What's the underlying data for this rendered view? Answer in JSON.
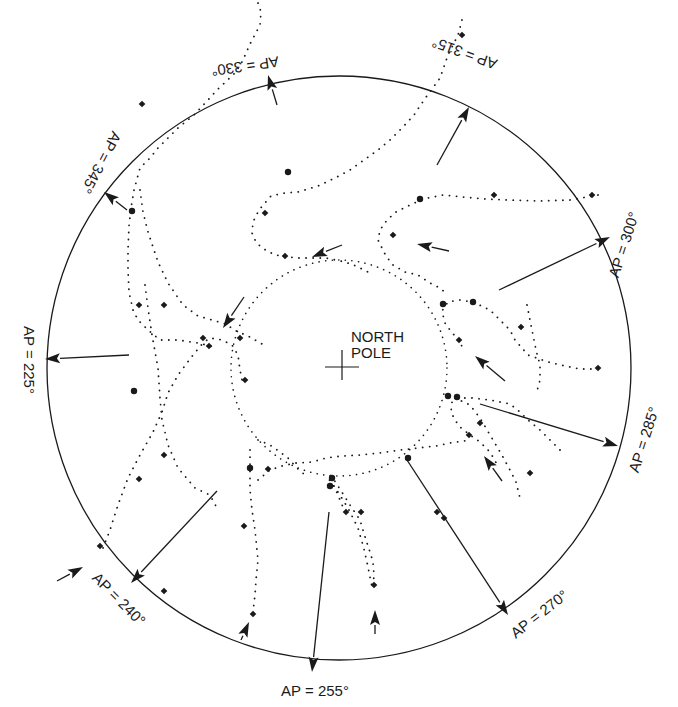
{
  "diagram": {
    "center_label_line1": "NORTH",
    "center_label_line2": "POLE",
    "top_clipped_text": "",
    "colors": {
      "ink": "#1a1a1a",
      "background": "#ffffff"
    },
    "outer_circle": {
      "cx": 339,
      "cy": 368,
      "r": 292
    },
    "inner_dotted_circle": {
      "cx": 339,
      "cy": 368,
      "r": 108
    },
    "labels": [
      {
        "text": "AP = 330°",
        "x": 245,
        "y": 65,
        "rotate": 172
      },
      {
        "text": "AP = 315°",
        "x": 465,
        "y": 52,
        "rotate": 200
      },
      {
        "text": "AP = 345°",
        "x": 100,
        "y": 162,
        "rotate": 118
      },
      {
        "text": "AP = 300°",
        "x": 625,
        "y": 245,
        "rotate": -72
      },
      {
        "text": "AP = 225°",
        "x": 28,
        "y": 360,
        "rotate": 90
      },
      {
        "text": "AP = 285°",
        "x": 645,
        "y": 440,
        "rotate": -72
      },
      {
        "text": "AP = 240°",
        "x": 118,
        "y": 600,
        "rotate": 45
      },
      {
        "text": "AP = 270°",
        "x": 540,
        "y": 615,
        "rotate": -38
      },
      {
        "text": "AP = 255°",
        "x": 315,
        "y": 692,
        "rotate": 0
      }
    ],
    "arrows": [
      {
        "x1": 277,
        "y1": 105,
        "x2": 268,
        "y2": 75
      },
      {
        "x1": 437,
        "y1": 165,
        "x2": 469,
        "y2": 107
      },
      {
        "x1": 127,
        "y1": 210,
        "x2": 104,
        "y2": 192
      },
      {
        "x1": 499,
        "y1": 290,
        "x2": 610,
        "y2": 237
      },
      {
        "x1": 129,
        "y1": 355,
        "x2": 45,
        "y2": 359
      },
      {
        "x1": 480,
        "y1": 404,
        "x2": 618,
        "y2": 446
      },
      {
        "x1": 217,
        "y1": 491,
        "x2": 131,
        "y2": 583
      },
      {
        "x1": 407,
        "y1": 460,
        "x2": 508,
        "y2": 615
      },
      {
        "x1": 329,
        "y1": 512,
        "x2": 312,
        "y2": 672
      },
      {
        "x1": 342,
        "y1": 245,
        "x2": 312,
        "y2": 257
      },
      {
        "x1": 244,
        "y1": 297,
        "x2": 223,
        "y2": 328
      },
      {
        "x1": 449,
        "y1": 251,
        "x2": 417,
        "y2": 244
      },
      {
        "x1": 505,
        "y1": 381,
        "x2": 475,
        "y2": 356
      },
      {
        "x1": 502,
        "y1": 481,
        "x2": 484,
        "y2": 456
      },
      {
        "x1": 57,
        "y1": 581,
        "x2": 83,
        "y2": 567
      },
      {
        "x1": 241,
        "y1": 640,
        "x2": 249,
        "y2": 622
      },
      {
        "x1": 375,
        "y1": 634,
        "x2": 375,
        "y2": 610
      }
    ],
    "tracks": [
      {
        "name": "track-330",
        "points": [
          [
            258,
            3
          ],
          [
            261,
            12
          ],
          [
            260,
            25
          ],
          [
            250,
            44
          ],
          [
            243,
            60
          ],
          [
            236,
            72
          ],
          [
            217,
            90
          ],
          [
            208,
            100
          ],
          [
            194,
            115
          ],
          [
            178,
            128
          ],
          [
            168,
            138
          ],
          [
            158,
            148
          ],
          [
            150,
            158
          ],
          [
            140,
            168
          ],
          [
            134,
            190
          ],
          [
            131,
            208
          ],
          [
            129,
            226
          ],
          [
            128,
            250
          ],
          [
            128,
            270
          ],
          [
            129,
            292
          ],
          [
            133,
            310
          ],
          [
            138,
            320
          ],
          [
            148,
            330
          ],
          [
            160,
            340
          ],
          [
            178,
            340
          ],
          [
            198,
            343
          ],
          [
            214,
            347
          ]
        ]
      },
      {
        "name": "track-315",
        "points": [
          [
            462,
            20
          ],
          [
            458,
            35
          ],
          [
            448,
            55
          ],
          [
            440,
            78
          ],
          [
            424,
            100
          ],
          [
            414,
            115
          ],
          [
            402,
            128
          ],
          [
            390,
            140
          ],
          [
            378,
            150
          ],
          [
            364,
            160
          ],
          [
            350,
            170
          ],
          [
            335,
            178
          ],
          [
            318,
            186
          ],
          [
            298,
            192
          ],
          [
            285,
            193
          ],
          [
            271,
            196
          ],
          [
            259,
            210
          ],
          [
            253,
            222
          ],
          [
            252,
            233
          ],
          [
            256,
            242
          ],
          [
            262,
            248
          ],
          [
            275,
            255
          ],
          [
            296,
            258
          ],
          [
            326,
            258
          ],
          [
            345,
            262
          ],
          [
            356,
            266
          ],
          [
            368,
            272
          ]
        ]
      },
      {
        "name": "track-345-loop",
        "points": [
          [
            140,
            190
          ],
          [
            143,
            212
          ],
          [
            148,
            232
          ],
          [
            158,
            262
          ],
          [
            168,
            283
          ],
          [
            183,
            305
          ],
          [
            198,
            316
          ],
          [
            212,
            320
          ],
          [
            226,
            324
          ],
          [
            234,
            330
          ],
          [
            248,
            336
          ],
          [
            262,
            344
          ]
        ]
      },
      {
        "name": "track-300",
        "points": [
          [
            598,
            195
          ],
          [
            570,
            200
          ],
          [
            540,
            201
          ],
          [
            510,
            200
          ],
          [
            485,
            199
          ],
          [
            462,
            197
          ],
          [
            443,
            195
          ],
          [
            423,
            199
          ],
          [
            410,
            205
          ],
          [
            396,
            212
          ],
          [
            387,
            220
          ],
          [
            380,
            230
          ],
          [
            378,
            240
          ],
          [
            386,
            256
          ],
          [
            393,
            265
          ],
          [
            405,
            272
          ],
          [
            418,
            275
          ],
          [
            430,
            283
          ],
          [
            440,
            288
          ],
          [
            448,
            295
          ]
        ]
      },
      {
        "name": "track-285",
        "points": [
          [
            598,
            369
          ],
          [
            580,
            369
          ],
          [
            565,
            366
          ],
          [
            548,
            362
          ],
          [
            528,
            355
          ],
          [
            515,
            340
          ],
          [
            510,
            330
          ],
          [
            500,
            320
          ],
          [
            490,
            310
          ],
          [
            473,
            302
          ],
          [
            460,
            300
          ],
          [
            448,
            302
          ],
          [
            442,
            311
          ],
          [
            445,
            323
          ],
          [
            452,
            333
          ],
          [
            460,
            340
          ],
          [
            462,
            347
          ]
        ]
      },
      {
        "name": "track-285b",
        "points": [
          [
            527,
            305
          ],
          [
            530,
            320
          ],
          [
            533,
            335
          ],
          [
            536,
            350
          ],
          [
            540,
            365
          ],
          [
            540,
            380
          ],
          [
            536,
            395
          ]
        ]
      },
      {
        "name": "track-270a",
        "points": [
          [
            560,
            450
          ],
          [
            550,
            440
          ],
          [
            540,
            430
          ],
          [
            528,
            420
          ],
          [
            520,
            412
          ],
          [
            510,
            404
          ],
          [
            490,
            400
          ],
          [
            472,
            398
          ],
          [
            460,
            398
          ],
          [
            452,
            402
          ],
          [
            451,
            412
          ],
          [
            455,
            420
          ],
          [
            460,
            427
          ],
          [
            470,
            435
          ],
          [
            480,
            442
          ],
          [
            490,
            452
          ],
          [
            498,
            466
          ]
        ]
      },
      {
        "name": "track-270b",
        "points": [
          [
            455,
            398
          ],
          [
            470,
            405
          ],
          [
            480,
            418
          ],
          [
            493,
            440
          ],
          [
            503,
            457
          ],
          [
            510,
            470
          ],
          [
            516,
            482
          ],
          [
            520,
            498
          ]
        ]
      },
      {
        "name": "track-255",
        "points": [
          [
            345,
            512
          ],
          [
            335,
            488
          ],
          [
            328,
            478
          ],
          [
            330,
            475
          ],
          [
            334,
            480
          ],
          [
            340,
            489
          ],
          [
            350,
            505
          ],
          [
            360,
            520
          ],
          [
            366,
            540
          ],
          [
            370,
            552
          ],
          [
            373,
            562
          ],
          [
            374,
            575
          ],
          [
            373,
            588
          ]
        ]
      },
      {
        "name": "track-255b",
        "points": [
          [
            330,
            480
          ],
          [
            338,
            492
          ],
          [
            348,
            508
          ],
          [
            358,
            528
          ],
          [
            364,
            549
          ],
          [
            368,
            567
          ],
          [
            372,
            587
          ]
        ]
      },
      {
        "name": "track-240",
        "points": [
          [
            250,
            450
          ],
          [
            250,
            470
          ],
          [
            250,
            490
          ],
          [
            252,
            510
          ],
          [
            255,
            530
          ],
          [
            258,
            560
          ],
          [
            256,
            580
          ],
          [
            255,
            595
          ],
          [
            253,
            612
          ]
        ]
      },
      {
        "name": "track-240b",
        "points": [
          [
            258,
            440
          ],
          [
            263,
            442
          ],
          [
            270,
            445
          ],
          [
            280,
            452
          ],
          [
            288,
            458
          ],
          [
            297,
            468
          ],
          [
            305,
            475
          ]
        ]
      },
      {
        "name": "track-225-loop",
        "points": [
          [
            103,
            548
          ],
          [
            110,
            530
          ],
          [
            118,
            505
          ],
          [
            128,
            478
          ],
          [
            140,
            455
          ],
          [
            153,
            432
          ],
          [
            162,
            412
          ],
          [
            168,
            393
          ],
          [
            178,
            375
          ],
          [
            193,
            355
          ],
          [
            203,
            343
          ],
          [
            210,
            338
          ],
          [
            222,
            340
          ],
          [
            232,
            345
          ],
          [
            238,
            355
          ],
          [
            240,
            370
          ],
          [
            243,
            385
          ]
        ]
      },
      {
        "name": "track-225b",
        "points": [
          [
            145,
            285
          ],
          [
            148,
            308
          ],
          [
            152,
            335
          ],
          [
            158,
            368
          ],
          [
            160,
            398
          ],
          [
            162,
            420
          ],
          [
            168,
            445
          ],
          [
            178,
            468
          ],
          [
            195,
            488
          ],
          [
            210,
            495
          ],
          [
            218,
            510
          ]
        ]
      },
      {
        "name": "track-mid",
        "points": [
          [
            258,
            480
          ],
          [
            270,
            470
          ],
          [
            282,
            466
          ],
          [
            296,
            463
          ],
          [
            312,
            462
          ],
          [
            326,
            458
          ],
          [
            342,
            456
          ],
          [
            360,
            455
          ],
          [
            380,
            453
          ],
          [
            400,
            450
          ],
          [
            418,
            448
          ],
          [
            436,
            446
          ],
          [
            450,
            443
          ],
          [
            470,
            440
          ]
        ]
      }
    ],
    "markers": [
      {
        "x": 462,
        "y": 35,
        "shape": "diamond"
      },
      {
        "x": 142,
        "y": 104,
        "shape": "diamond"
      },
      {
        "x": 132,
        "y": 211,
        "shape": "circle"
      },
      {
        "x": 288,
        "y": 172,
        "shape": "circle"
      },
      {
        "x": 265,
        "y": 213,
        "shape": "diamond"
      },
      {
        "x": 285,
        "y": 256,
        "shape": "diamond"
      },
      {
        "x": 393,
        "y": 235,
        "shape": "diamond"
      },
      {
        "x": 420,
        "y": 199,
        "shape": "circle"
      },
      {
        "x": 494,
        "y": 195,
        "shape": "diamond"
      },
      {
        "x": 592,
        "y": 195,
        "shape": "diamond"
      },
      {
        "x": 473,
        "y": 302,
        "shape": "circle"
      },
      {
        "x": 443,
        "y": 304,
        "shape": "circle"
      },
      {
        "x": 521,
        "y": 327,
        "shape": "diamond"
      },
      {
        "x": 459,
        "y": 340,
        "shape": "diamond"
      },
      {
        "x": 598,
        "y": 368,
        "shape": "diamond"
      },
      {
        "x": 448,
        "y": 396,
        "shape": "circle"
      },
      {
        "x": 457,
        "y": 397,
        "shape": "circle"
      },
      {
        "x": 480,
        "y": 423,
        "shape": "diamond"
      },
      {
        "x": 469,
        "y": 435,
        "shape": "diamond"
      },
      {
        "x": 530,
        "y": 473,
        "shape": "diamond"
      },
      {
        "x": 408,
        "y": 458,
        "shape": "circle"
      },
      {
        "x": 437,
        "y": 512,
        "shape": "diamond"
      },
      {
        "x": 444,
        "y": 518,
        "shape": "diamond"
      },
      {
        "x": 250,
        "y": 468,
        "shape": "circle"
      },
      {
        "x": 268,
        "y": 469,
        "shape": "diamond"
      },
      {
        "x": 244,
        "y": 526,
        "shape": "diamond"
      },
      {
        "x": 253,
        "y": 614,
        "shape": "diamond"
      },
      {
        "x": 332,
        "y": 478,
        "shape": "circle"
      },
      {
        "x": 330,
        "y": 486,
        "shape": "circle"
      },
      {
        "x": 346,
        "y": 512,
        "shape": "diamond"
      },
      {
        "x": 361,
        "y": 512,
        "shape": "diamond"
      },
      {
        "x": 374,
        "y": 585,
        "shape": "diamond"
      },
      {
        "x": 240,
        "y": 338,
        "shape": "diamond"
      },
      {
        "x": 203,
        "y": 338,
        "shape": "diamond"
      },
      {
        "x": 209,
        "y": 346,
        "shape": "diamond"
      },
      {
        "x": 164,
        "y": 305,
        "shape": "diamond"
      },
      {
        "x": 139,
        "y": 305,
        "shape": "diamond"
      },
      {
        "x": 164,
        "y": 455,
        "shape": "diamond"
      },
      {
        "x": 164,
        "y": 591,
        "shape": "diamond"
      },
      {
        "x": 139,
        "y": 479,
        "shape": "diamond"
      },
      {
        "x": 245,
        "y": 380,
        "shape": "diamond"
      },
      {
        "x": 134,
        "y": 391,
        "shape": "circle"
      },
      {
        "x": 100,
        "y": 546,
        "shape": "diamond"
      }
    ]
  }
}
